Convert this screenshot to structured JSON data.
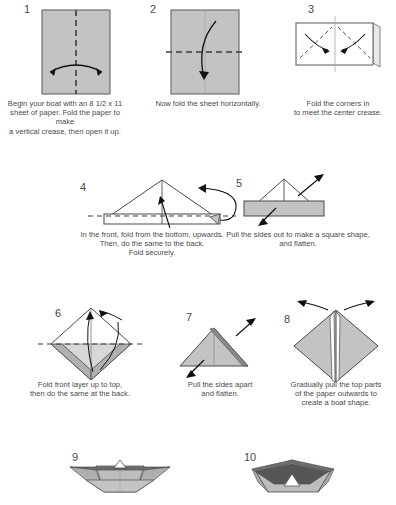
{
  "page": {
    "background_color": "#ffffff",
    "paper_fill": "#c3c3c3",
    "paper_stroke": "#555555",
    "dark_fill": "#8f8f8f",
    "darker_fill": "#6e6e6e",
    "white_fill": "#ffffff",
    "text_color": "#4a4a4a"
  },
  "steps": [
    {
      "number": "1",
      "caption": "Begin your boat with an 8 1/2 x 11\nsheet of paper. Fold the paper to make\na  vertical crease, then open it up.",
      "diagram_name": "portrait-sheet-vertical-crease"
    },
    {
      "number": "2",
      "caption": "Now fold the sheet horizontally.",
      "diagram_name": "portrait-sheet-horizontal-crease"
    },
    {
      "number": "3",
      "caption": "Fold the corners in\nto meet the center crease.",
      "diagram_name": "landscape-sheet-corner-folds"
    },
    {
      "number": "4",
      "caption": "In the front, fold from the bottom, upwards.\nThen, do the same to the back.\nFold securely.",
      "diagram_name": "triangle-with-band"
    },
    {
      "number": "5",
      "caption": "Pull the sides out to make a square shape,\nand flatten.",
      "diagram_name": "triangle-on-bar"
    },
    {
      "number": "6",
      "caption": "Fold front layer up to top,\nthen do the same at the back.",
      "diagram_name": "diamond-fold-up"
    },
    {
      "number": "7",
      "caption": "Pull the sides apart\nand flatten.",
      "diagram_name": "flat-triangle"
    },
    {
      "number": "8",
      "caption": "Gradually pull the top parts\nof the paper outwards to\ncreate a boat shape.",
      "diagram_name": "diamond-with-slit"
    },
    {
      "number": "9",
      "caption": "",
      "diagram_name": "boat-front-view"
    },
    {
      "number": "10",
      "caption": "",
      "diagram_name": "boat-angled-view"
    }
  ]
}
